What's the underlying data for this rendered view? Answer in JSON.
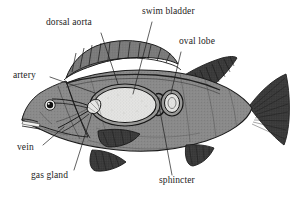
{
  "figure": {
    "background_color": "#ffffff",
    "body_color": "#8a8a8a",
    "fin_dark_color": "#3a3a3a",
    "bladder_color": "#e2e2e2",
    "label_color": "#1c1c1c",
    "leader_line_color": "#1c1c1c"
  },
  "labels": {
    "dorsal_aorta": "dorsal aorta",
    "swim_bladder": "swim bladder",
    "oval_lobe": "oval lobe",
    "artery": "artery",
    "vein": "vein",
    "gas_gland": "gas gland",
    "sphincter": "sphincter"
  },
  "annotations": [
    {
      "id": "dorsal-aorta",
      "label": "dorsal aorta",
      "label_x": 46,
      "label_y": 17,
      "leader_from": [
        101,
        33
      ],
      "leader_to": [
        118,
        83
      ]
    },
    {
      "id": "swim-bladder",
      "label": "swim bladder",
      "label_x": 142,
      "label_y": 6,
      "leader_from": [
        152,
        22
      ],
      "leader_to": [
        133,
        96
      ]
    },
    {
      "id": "oval-lobe",
      "label": "oval lobe",
      "label_x": 179,
      "label_y": 36,
      "leader_from": [
        181,
        52
      ],
      "leader_to": [
        170,
        95
      ]
    },
    {
      "id": "artery",
      "label": "artery",
      "label_x": 13,
      "label_y": 70,
      "leader_from": [
        50,
        77
      ],
      "leader_to": [
        96,
        92
      ]
    },
    {
      "id": "vein",
      "label": "vein",
      "label_x": 17,
      "label_y": 142,
      "leader_from": [
        43,
        145
      ],
      "leader_to": [
        64,
        127
      ]
    },
    {
      "id": "gas-gland",
      "label": "gas gland",
      "label_x": 31,
      "label_y": 170,
      "leader_from": [
        74,
        170
      ],
      "leader_to": [
        92,
        113
      ]
    },
    {
      "id": "sphincter",
      "label": "sphincter",
      "label_x": 159,
      "label_y": 175,
      "leader_from": [
        172,
        175
      ],
      "leader_to": [
        160,
        112
      ]
    }
  ],
  "parts": [
    {
      "name": "body",
      "description": "fish body outline, mid-gray stippled"
    },
    {
      "name": "head",
      "description": "head with open mouth at left"
    },
    {
      "name": "eye",
      "description": "dark round eye with white highlight"
    },
    {
      "name": "spiny-dorsal-fin",
      "description": "ribbed spiny dorsal fin along upper back"
    },
    {
      "name": "soft-dorsal-fin",
      "description": "dark soft dorsal fin behind spiny fin"
    },
    {
      "name": "caudal-fin",
      "description": "dark fan-shaped tail fin"
    },
    {
      "name": "pectoral-fin",
      "description": "dark pectoral fin mid-body"
    },
    {
      "name": "pelvic-fin",
      "description": "dark pelvic fin on lower body"
    },
    {
      "name": "anal-fin",
      "description": "dark anal fin near tail underside"
    },
    {
      "name": "swim-bladder",
      "description": "large light stippled oval gas-filled organ"
    },
    {
      "name": "oval-lobe",
      "description": "small ringed oval lobe right of swim bladder"
    },
    {
      "name": "gas-gland",
      "description": "small knot of tissue at front of swim bladder"
    },
    {
      "name": "artery",
      "description": "vessel running to gas gland"
    },
    {
      "name": "vein",
      "description": "vessel running from gas gland"
    },
    {
      "name": "sphincter",
      "description": "muscular ring between bladder and oval lobe"
    },
    {
      "name": "dorsal-aorta",
      "description": "major vessel along the dorsal side"
    }
  ]
}
